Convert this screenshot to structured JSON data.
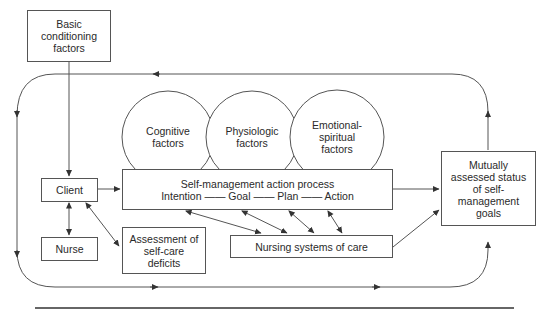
{
  "diagram": {
    "boxes": {
      "basic_conditioning": "Basic conditioning factors",
      "client": "Client",
      "nurse": "Nurse",
      "assessment": "Assessment of self-care deficits",
      "self_management_title": "Self-management action process",
      "self_management_steps": "Intention —— Goal —— Plan —— Action",
      "nursing_systems": "Nursing systems of care",
      "mutually_assessed": "Mutually assessed status of self-management goals"
    },
    "circles": [
      {
        "label": "Cognitive factors"
      },
      {
        "label": "Physiologic factors"
      },
      {
        "label": "Emotional-spiritual factors"
      }
    ],
    "colors": {
      "line": "#555555",
      "text": "#2a2a2a",
      "rule": "#333333"
    }
  }
}
